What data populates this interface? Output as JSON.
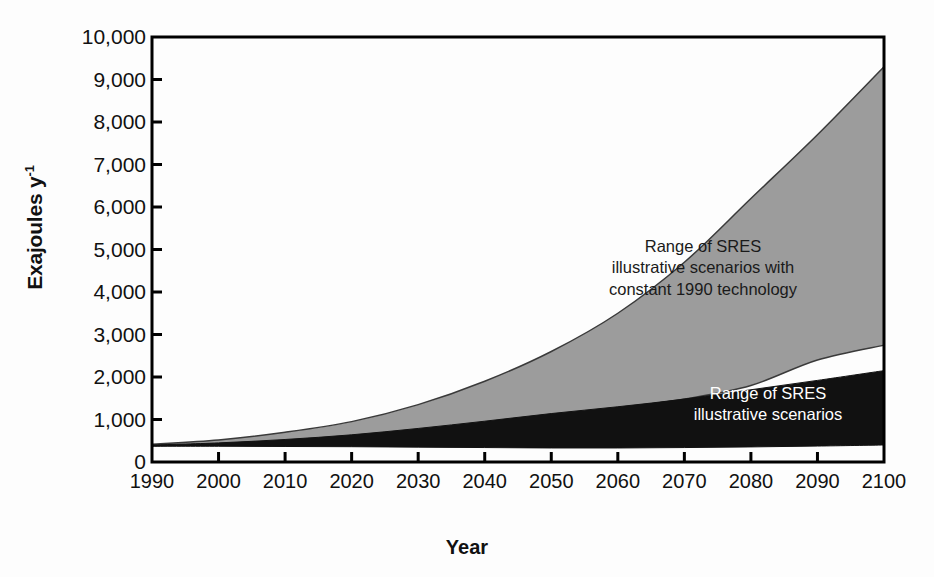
{
  "chart_data": {
    "type": "area",
    "title": "",
    "xlabel": "Year",
    "ylabel": "Exajoules y-1",
    "ylabel_base": "Exajoules y",
    "ylabel_exponent": "-1",
    "xlim": [
      1990,
      2100
    ],
    "ylim": [
      0,
      10000
    ],
    "grid": false,
    "legend_position": "in-plot annotations",
    "x": [
      1990,
      2000,
      2010,
      2020,
      2030,
      2040,
      2050,
      2060,
      2070,
      2080,
      2090,
      2100
    ],
    "xtick_labels": [
      "1990",
      "2000",
      "2010",
      "2020",
      "2030",
      "2040",
      "2050",
      "2060",
      "2070",
      "2080",
      "2090",
      "2100"
    ],
    "ytick_labels": [
      "0",
      "1,000",
      "2,000",
      "3,000",
      "4,000",
      "5,000",
      "6,000",
      "7,000",
      "8,000",
      "9,000",
      "10,000"
    ],
    "ytick_values": [
      0,
      1000,
      2000,
      3000,
      4000,
      5000,
      6000,
      7000,
      8000,
      9000,
      10000
    ],
    "series": [
      {
        "name": "Range of SRES illustrative scenarios with constant 1990 technology",
        "kind": "band",
        "fill": "#9c9c9c",
        "upper": [
          420,
          520,
          700,
          950,
          1350,
          1900,
          2600,
          3500,
          4700,
          6200,
          7700,
          9300
        ],
        "lower": [
          380,
          430,
          500,
          600,
          740,
          900,
          1080,
          1260,
          1480,
          1800,
          2400,
          2750
        ]
      },
      {
        "name": "Range of SRES illustrative scenarios",
        "kind": "band",
        "fill": "#111111",
        "upper": [
          400,
          450,
          530,
          640,
          790,
          960,
          1140,
          1300,
          1480,
          1700,
          1920,
          2150
        ],
        "lower": [
          370,
          370,
          365,
          360,
          350,
          340,
          330,
          330,
          340,
          355,
          375,
          400
        ]
      }
    ],
    "annotations": [
      {
        "id": "annot-upper",
        "lines": [
          "Range of SRES",
          "illustrative scenarios with",
          "constant 1990 technology"
        ],
        "color": "#1a1a1a"
      },
      {
        "id": "annot-lower",
        "lines": [
          "Range of SRES",
          "illustrative scenarios"
        ],
        "color": "#ffffff"
      }
    ],
    "colors": {
      "gray_band": "#9c9c9c",
      "black_band": "#111111",
      "axis": "#000000",
      "background": "#fdfdfd"
    }
  }
}
